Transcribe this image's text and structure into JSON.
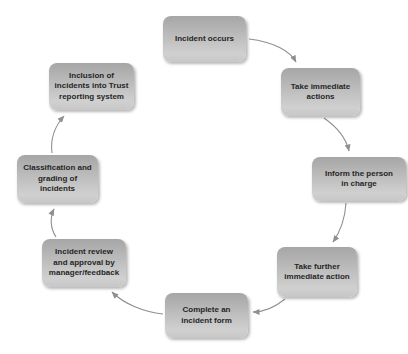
{
  "diagram": {
    "type": "cycle-flow",
    "colors": {
      "background": "#ffffff",
      "box_gradient_top": "#a6a6a6",
      "box_gradient_bottom": "#d0d0d0",
      "text": "#262626",
      "arrow": "#8f8f8f"
    },
    "nodes": [
      {
        "id": "incident-occurs",
        "label": "Incident occurs"
      },
      {
        "id": "take-immediate-actions",
        "label": "Take immediate\nactions"
      },
      {
        "id": "inform-person-in-charge",
        "label": "Inform the person\nin charge"
      },
      {
        "id": "take-further-immediate-action",
        "label": "Take further\nimmediate action"
      },
      {
        "id": "complete-incident-form",
        "label": "Complete an\nincident form"
      },
      {
        "id": "incident-review-approval",
        "label": "Incident review\nand approval by\nmanager/feedback"
      },
      {
        "id": "classification-grading",
        "label": "Classification and\ngrading of\nincidents"
      },
      {
        "id": "inclusion-trust-reporting",
        "label": "Inclusion of\nincidents into Trust\nreporting system"
      }
    ],
    "edges": [
      {
        "from": "incident-occurs",
        "to": "take-immediate-actions"
      },
      {
        "from": "take-immediate-actions",
        "to": "inform-person-in-charge"
      },
      {
        "from": "inform-person-in-charge",
        "to": "take-further-immediate-action"
      },
      {
        "from": "take-further-immediate-action",
        "to": "complete-incident-form"
      },
      {
        "from": "complete-incident-form",
        "to": "incident-review-approval"
      },
      {
        "from": "incident-review-approval",
        "to": "classification-grading"
      },
      {
        "from": "classification-grading",
        "to": "inclusion-trust-reporting"
      }
    ]
  }
}
